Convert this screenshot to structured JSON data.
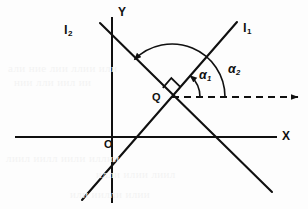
{
  "figure": {
    "kind": "coordinate-geometry-diagram",
    "width": 308,
    "height": 209,
    "background_color": "#fdfdfd",
    "ink_color": "#101010"
  },
  "axes": {
    "x_label": "X",
    "y_label": "Y",
    "origin_label": "O",
    "x_axis": {
      "x1": 16,
      "y1": 137,
      "x2": 276,
      "y2": 137
    },
    "y_axis": {
      "x1": 112,
      "y1": 18,
      "x2": 112,
      "y2": 202
    },
    "origin": {
      "x": 112,
      "y": 137
    },
    "x_label_pos": {
      "x": 282,
      "y": 130
    },
    "y_label_pos": {
      "x": 118,
      "y": 6
    },
    "origin_label_pos": {
      "x": 104,
      "y": 139
    }
  },
  "lines": [
    {
      "id": "l1",
      "label": "l",
      "subscript": "1",
      "x1": 82,
      "y1": 200,
      "x2": 237,
      "y2": 22,
      "label_pos": {
        "x": 243,
        "y": 21
      }
    },
    {
      "id": "l2",
      "label": "l",
      "subscript": "2",
      "x1": 100,
      "y1": 23,
      "x2": 272,
      "y2": 192,
      "label_pos": {
        "x": 64,
        "y": 23
      }
    }
  ],
  "intersection": {
    "label": "Q",
    "x": 172,
    "y": 97,
    "label_pos": {
      "x": 152,
      "y": 92
    }
  },
  "right_angle_marker": {
    "present": true,
    "size": 13,
    "between": [
      "l1",
      "l2"
    ],
    "vertex": {
      "x": 172,
      "y": 97
    }
  },
  "reference_ray": {
    "style": "dashed",
    "arrow": true,
    "from": {
      "x": 172,
      "y": 97
    },
    "to": {
      "x": 298,
      "y": 97
    },
    "dash_pattern": "7 5"
  },
  "angles": [
    {
      "id": "alpha1",
      "label": "α",
      "subscript": "1",
      "radius": 28,
      "from_deg": 0,
      "to_deg": 49,
      "arrow_at": "line-l1",
      "label_pos": {
        "x": 199,
        "y": 69
      }
    },
    {
      "id": "alpha2",
      "label": "α",
      "subscript": "2",
      "radius": 53,
      "from_deg": 0,
      "to_deg": 135,
      "arrow_at": "line-l2",
      "label_pos": {
        "x": 228,
        "y": 63
      }
    }
  ],
  "ghost_text": [
    {
      "text": "али ние лии ллии или",
      "x": 8,
      "y": 62
    },
    {
      "text": "нии лли иил ии",
      "x": 14,
      "y": 76
    },
    {
      "text": "лиил иилл иили иллии",
      "x": 6,
      "y": 152
    },
    {
      "text": "илли илии лиил",
      "x": 96,
      "y": 168
    },
    {
      "text": "или иилли илии",
      "x": 70,
      "y": 188
    }
  ]
}
